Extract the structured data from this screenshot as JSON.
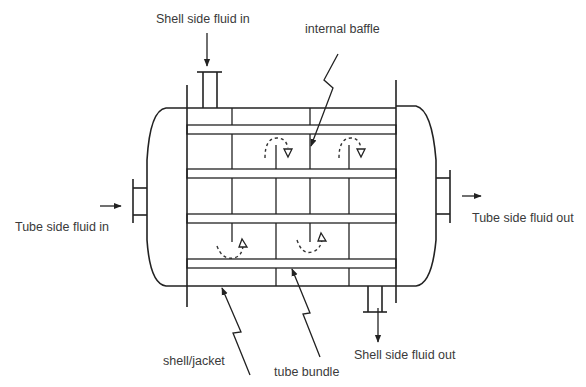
{
  "diagram": {
    "labels": {
      "shell_in": "Shell side fluid in",
      "internal_baffle": "internal baffle",
      "tube_in": "Tube side fluid in",
      "tube_out": "Tube side fluid out",
      "shell_jacket": "shell/jacket",
      "tube_bundle": "tube bundle",
      "shell_out": "Shell side fluid out"
    },
    "components": [
      {
        "id": "shell",
        "label": "shell/jacket"
      },
      {
        "id": "tube-bundle",
        "label": "tube bundle",
        "tube_count": 4
      },
      {
        "id": "baffles",
        "label": "internal baffle"
      },
      {
        "id": "tube-inlet-nozzle",
        "label": "Tube side fluid in"
      },
      {
        "id": "tube-outlet-nozzle",
        "label": "Tube side fluid out"
      },
      {
        "id": "shell-inlet-nozzle",
        "label": "Shell side fluid in"
      },
      {
        "id": "shell-outlet-nozzle",
        "label": "Shell side fluid out"
      }
    ],
    "colors": {
      "line": "#222222",
      "text": "#3a3a3a",
      "background": "#ffffff"
    }
  }
}
